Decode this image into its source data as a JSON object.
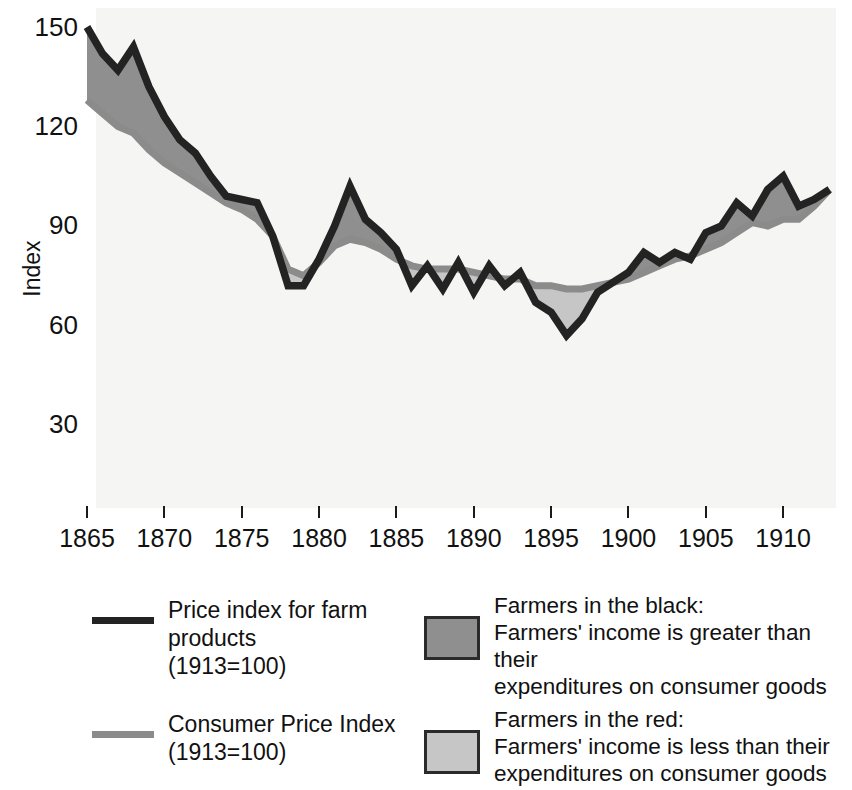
{
  "chart_data": {
    "type": "area",
    "title": "",
    "xlabel": "",
    "ylabel": "Index",
    "xlim": [
      1865,
      1913
    ],
    "ylim": [
      0,
      152
    ],
    "grid": false,
    "x_ticks": [
      1865,
      1870,
      1875,
      1880,
      1885,
      1890,
      1895,
      1900,
      1905,
      1910
    ],
    "y_ticks": [
      30,
      60,
      90,
      120,
      150
    ],
    "legend_position": "below-plot",
    "x": [
      1865,
      1866,
      1867,
      1868,
      1869,
      1870,
      1871,
      1872,
      1873,
      1874,
      1875,
      1876,
      1877,
      1878,
      1879,
      1880,
      1881,
      1882,
      1883,
      1884,
      1885,
      1886,
      1887,
      1888,
      1889,
      1890,
      1891,
      1892,
      1893,
      1894,
      1895,
      1896,
      1897,
      1898,
      1899,
      1900,
      1901,
      1902,
      1903,
      1904,
      1905,
      1906,
      1907,
      1908,
      1909,
      1910,
      1911,
      1912,
      1913
    ],
    "series": [
      {
        "name": "Price index for farm products (1913=100)",
        "color": "#232323",
        "values": [
          150,
          142,
          137,
          144,
          132,
          123,
          116,
          112,
          105,
          99,
          98,
          97,
          87,
          72,
          72,
          80,
          90,
          102,
          92,
          88,
          83,
          72,
          78,
          71,
          79,
          70,
          78,
          72,
          76,
          67,
          64,
          57,
          62,
          70,
          73,
          76,
          82,
          79,
          82,
          80,
          88,
          90,
          97,
          93,
          101,
          105,
          96,
          98,
          101
        ]
      },
      {
        "name": "Consumer Price Index (1913=100)",
        "color": "#8b8b8b",
        "values": [
          128,
          124,
          120,
          118,
          113,
          109,
          106,
          103,
          100,
          97,
          95,
          92,
          87,
          77,
          75,
          79,
          84,
          86,
          85,
          83,
          80,
          78,
          77,
          77,
          77,
          76,
          75,
          74,
          74,
          72,
          72,
          71,
          71,
          72,
          73,
          74,
          76,
          78,
          80,
          81,
          83,
          85,
          88,
          91,
          90,
          92,
          92,
          96,
          101
        ]
      }
    ],
    "bands": [
      {
        "name": "Farmers in the black",
        "color": "#8f8f8f",
        "rule": "farm price index above CPI"
      },
      {
        "name": "Farmers in the red",
        "color": "#c6c6c6",
        "rule": "farm price index below CPI"
      }
    ]
  },
  "axes": {
    "y_title": "Index",
    "y_ticks": [
      "150",
      "120",
      "90",
      "60",
      "30"
    ],
    "x_ticks": [
      "1865",
      "1870",
      "1875",
      "1880",
      "1885",
      "1890",
      "1895",
      "1900",
      "1905",
      "1910"
    ]
  },
  "legend": {
    "lines": [
      {
        "swatch": "black",
        "line1": "Price index for farm products",
        "line2": "(1913=100)"
      },
      {
        "swatch": "gray",
        "line1": "Consumer Price Index",
        "line2": "(1913=100)"
      }
    ],
    "bands": [
      {
        "swatch_color": "#8f8f8f",
        "heading": "Farmers in the black:",
        "line1": "Farmers' income is greater than their",
        "line2": "expenditures on consumer goods"
      },
      {
        "swatch_color": "#c6c6c6",
        "heading": "Farmers in the red:",
        "line1": "Farmers' income is less than their",
        "line2": "expenditures on consumer goods"
      }
    ]
  },
  "colors": {
    "farm_line": "#232323",
    "cpi_line": "#8b8b8b",
    "band_black": "#8f8f8f",
    "band_red": "#c6c6c6",
    "plot_background": "#f3f3f1"
  }
}
